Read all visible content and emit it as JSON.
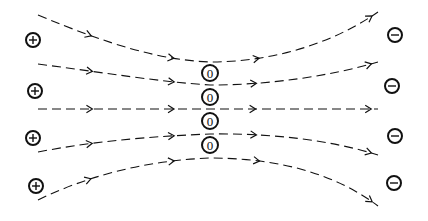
{
  "diagram": {
    "colors": {
      "ink": "#111111",
      "background": "#ffffff"
    },
    "positive_charges": [
      {
        "symbol": "+",
        "x": 33,
        "y": 40
      },
      {
        "symbol": "+",
        "x": 35,
        "y": 91
      },
      {
        "symbol": "+",
        "x": 33,
        "y": 138
      },
      {
        "symbol": "+",
        "x": 36,
        "y": 186
      }
    ],
    "negative_charges": [
      {
        "symbol": "−",
        "x": 395,
        "y": 35
      },
      {
        "symbol": "−",
        "x": 392,
        "y": 86
      },
      {
        "symbol": "−",
        "x": 395,
        "y": 136
      },
      {
        "symbol": "−",
        "x": 394,
        "y": 183
      }
    ],
    "neutral_points": [
      {
        "label": "0",
        "x": 210,
        "y": 73
      },
      {
        "label": "0",
        "x": 210,
        "y": 97
      },
      {
        "label": "0",
        "x": 210,
        "y": 121
      },
      {
        "label": "0",
        "x": 210,
        "y": 145
      }
    ],
    "field_lines": [
      {
        "path": "M38,15 C110,45 160,60 210,62 C270,62 330,45 378,12"
      },
      {
        "path": "M38,64 C100,72 160,82 210,85 C270,85 330,76 378,62"
      },
      {
        "path": "M38,109 L378,109"
      },
      {
        "path": "M38,152 C100,140 160,136 210,134 C270,133 330,140 378,155"
      },
      {
        "path": "M38,200 C100,170 160,160 210,158 C270,158 330,170 378,206"
      }
    ]
  }
}
